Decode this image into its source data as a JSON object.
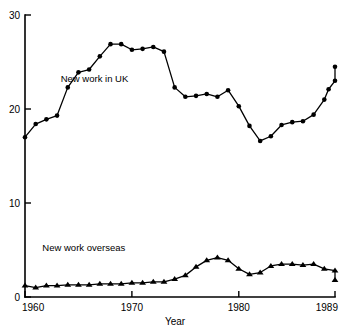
{
  "chart_data": {
    "type": "line",
    "title": "",
    "xlabel": "Year",
    "ylabel": "",
    "xlim": [
      1960,
      1989
    ],
    "ylim": [
      0,
      30
    ],
    "grid": false,
    "legend_position": "inline-annotation",
    "x_ticks": [
      1960,
      1970,
      1980,
      1989
    ],
    "x_tick_labels": [
      "1960",
      "1970",
      "1980",
      "1989"
    ],
    "y_ticks": [
      0,
      10,
      20,
      30
    ],
    "y_tick_labels": [
      "0",
      "10",
      "20",
      "30"
    ],
    "x": [
      1960,
      1961,
      1962,
      1963,
      1964,
      1965,
      1966,
      1967,
      1968,
      1969,
      1970,
      1971,
      1972,
      1973,
      1974,
      1975,
      1976,
      1977,
      1978,
      1979,
      1980,
      1981,
      1982,
      1983,
      1984,
      1985,
      1986,
      1987,
      1988,
      1989
    ],
    "series": [
      {
        "name": "New work in UK",
        "marker": "circle",
        "values": [
          17.0,
          18.4,
          18.9,
          19.3,
          22.3,
          23.9,
          24.2,
          25.6,
          26.9,
          26.9,
          26.3,
          26.4,
          26.6,
          26.1,
          22.3,
          21.3,
          21.4,
          21.6,
          21.3,
          22.0,
          20.3,
          18.2,
          16.6,
          17.1,
          18.3,
          18.6,
          18.7,
          19.4,
          21.0,
          23.0
        ],
        "annotation": {
          "text": "New work in UK",
          "x": 1966.5,
          "y": 22.9
        }
      },
      {
        "name": "New work overseas",
        "marker": "triangle",
        "values": [
          1.2,
          1.0,
          1.2,
          1.2,
          1.3,
          1.3,
          1.3,
          1.4,
          1.4,
          1.4,
          1.5,
          1.5,
          1.6,
          1.6,
          1.9,
          2.3,
          3.2,
          3.9,
          4.2,
          3.9,
          3.0,
          2.4,
          2.6,
          3.3,
          3.5,
          3.5,
          3.4,
          3.5,
          3.0,
          2.8
        ],
        "annotation": {
          "text": "New work overseas",
          "x": 1965.5,
          "y": 4.9
        }
      }
    ],
    "series_extra_points": {
      "New work in UK": [
        {
          "x": 1988.4,
          "y": 22.1
        },
        {
          "x": 1989.0,
          "y": 24.5
        }
      ],
      "New work overseas": [
        {
          "x": 1989.0,
          "y": 1.8
        }
      ]
    },
    "colors": {
      "axis": "#000000",
      "series_uk": "#000000",
      "series_overseas": "#000000",
      "background": "#ffffff"
    }
  },
  "labels": {
    "x_axis_title": "Year",
    "uk_series_label": "New work in UK",
    "overseas_series_label": "New work overseas"
  }
}
